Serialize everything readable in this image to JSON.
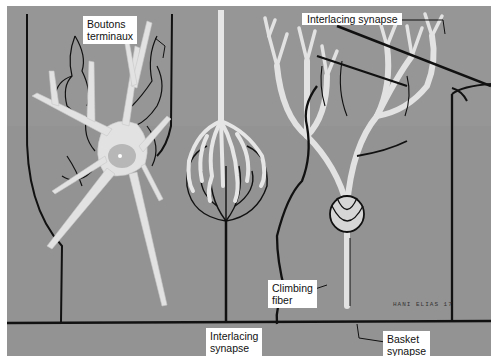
{
  "figure": {
    "background_color": "#959595",
    "line_color": "#111111",
    "cell_color": "#e6e6e6"
  },
  "labels": {
    "boutons": {
      "line1": "Boutons",
      "line2": "terminaux"
    },
    "interlacing_top": {
      "line1": "Interlacing synapse"
    },
    "interlacing_bottom": {
      "line1": "Interlacing",
      "line2": "synapse"
    },
    "climbing": {
      "line1": "Climbing",
      "line2": "fiber"
    },
    "basket": {
      "line1": "Basket",
      "line2": "synapse"
    }
  },
  "signature": "HANI ELIAS 17"
}
